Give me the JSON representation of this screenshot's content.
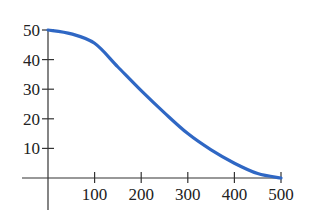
{
  "chart_data": {
    "type": "line",
    "title": "",
    "xlabel": "",
    "ylabel": "",
    "x": [
      0,
      50,
      100,
      150,
      200,
      250,
      300,
      350,
      400,
      450,
      500
    ],
    "series": [
      {
        "name": "curve",
        "color": "#2f67c4",
        "values": [
          50,
          48.7,
          45.5,
          37.5,
          29.5,
          22,
          15,
          9.5,
          5,
          1.5,
          0
        ]
      }
    ],
    "xlim": [
      0,
      500
    ],
    "ylim": [
      0,
      50
    ],
    "x_ticks": [
      100,
      200,
      300,
      400,
      500
    ],
    "y_ticks": [
      10,
      20,
      30,
      40,
      50
    ],
    "x_tick_labels": [
      "100",
      "200",
      "300",
      "400",
      "500"
    ],
    "y_tick_labels": [
      "10",
      "20",
      "30",
      "40",
      "50"
    ],
    "grid": false,
    "legend": "none"
  }
}
